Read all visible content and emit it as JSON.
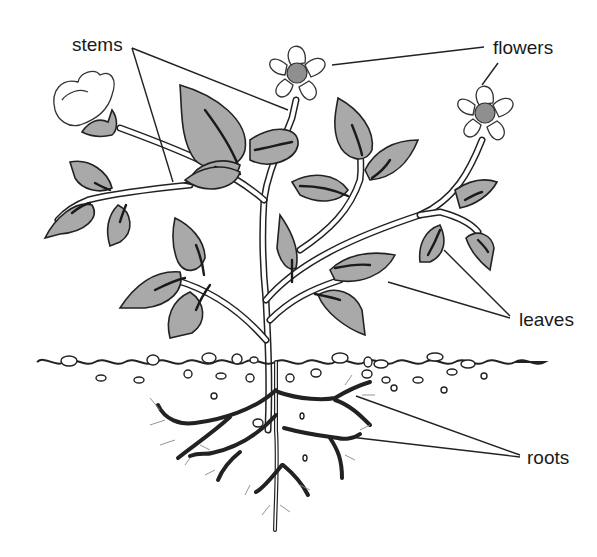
{
  "diagram": {
    "labels": {
      "stems": "stems",
      "flowers": "flowers",
      "leaves": "leaves",
      "roots": "roots"
    },
    "colors": {
      "leaf_fill": "#a9a9a9",
      "outline": "#222222",
      "flower_center": "#8f8f8f",
      "background": "#ffffff"
    },
    "parts": [
      {
        "name": "stems",
        "pointer_count": 2
      },
      {
        "name": "flowers",
        "pointer_count": 2
      },
      {
        "name": "leaves",
        "pointer_count": 2
      },
      {
        "name": "roots",
        "pointer_count": 2
      }
    ]
  }
}
